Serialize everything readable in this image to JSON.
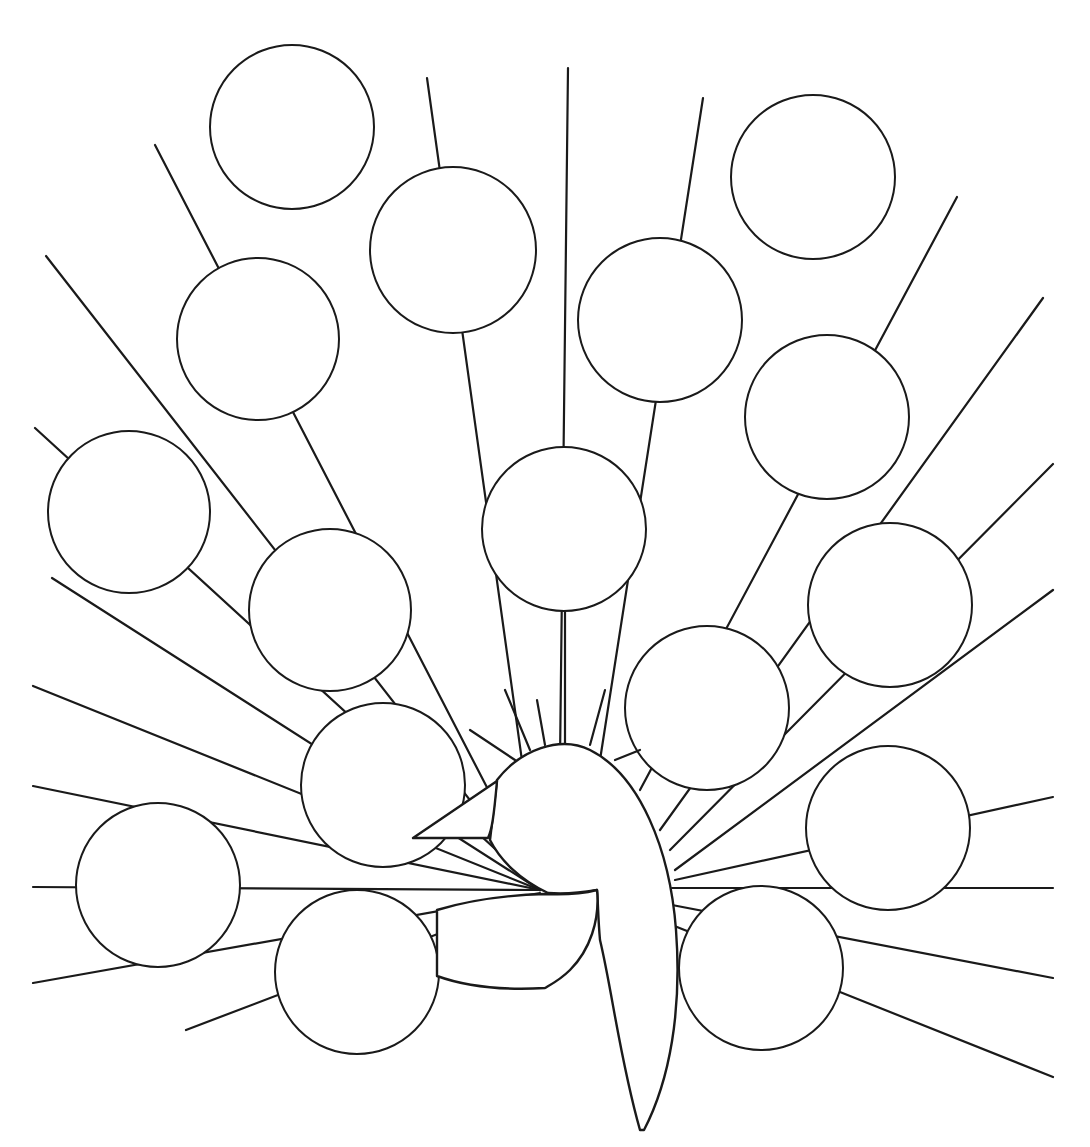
{
  "illustration": {
    "subject": "peacock coloring page",
    "stroke_color": "#1a1a1a",
    "background_color": "#ffffff",
    "feather_count": 19
  },
  "feathers": [
    {
      "cx": 292,
      "cy": 127,
      "r": 82
    },
    {
      "cx": 453,
      "cy": 250,
      "r": 83
    },
    {
      "cx": 813,
      "cy": 177,
      "r": 82
    },
    {
      "cx": 258,
      "cy": 339,
      "r": 81
    },
    {
      "cx": 660,
      "cy": 320,
      "r": 82
    },
    {
      "cx": 827,
      "cy": 417,
      "r": 82
    },
    {
      "cx": 129,
      "cy": 512,
      "r": 81
    },
    {
      "cx": 330,
      "cy": 610,
      "r": 81
    },
    {
      "cx": 564,
      "cy": 529,
      "r": 82
    },
    {
      "cx": 890,
      "cy": 605,
      "r": 82
    },
    {
      "cx": 707,
      "cy": 708,
      "r": 82
    },
    {
      "cx": 383,
      "cy": 785,
      "r": 82
    },
    {
      "cx": 888,
      "cy": 828,
      "r": 82
    },
    {
      "cx": 158,
      "cy": 885,
      "r": 82
    },
    {
      "cx": 357,
      "cy": 972,
      "r": 82
    },
    {
      "cx": 761,
      "cy": 968,
      "r": 82
    }
  ]
}
